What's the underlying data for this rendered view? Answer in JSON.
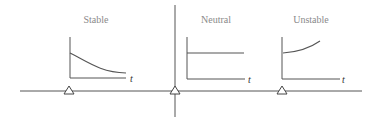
{
  "diagram": {
    "panels": [
      {
        "title": "Stable",
        "axis_label": "t",
        "behavior": "decaying"
      },
      {
        "title": "Neutral",
        "axis_label": "t",
        "behavior": "constant"
      },
      {
        "title": "Unstable",
        "axis_label": "t",
        "behavior": "growing"
      }
    ],
    "colors": {
      "title": "#8a8a8a",
      "line": "#555555"
    }
  }
}
